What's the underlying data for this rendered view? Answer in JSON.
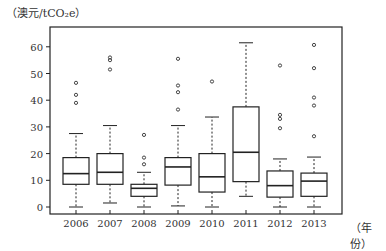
{
  "chart_data": {
    "type": "box",
    "title": "",
    "xlabel": "（年份）",
    "ylabel": "（澳元/tCO₂e）",
    "ylim": [
      0,
      65
    ],
    "yticks": [
      0,
      10,
      20,
      30,
      40,
      50,
      60
    ],
    "categories": [
      "2006",
      "2007",
      "2008",
      "2009",
      "2010",
      "2011",
      "2012",
      "2013"
    ],
    "boxes": [
      {
        "year": "2006",
        "whisker_low": 0,
        "q1": 8.5,
        "median": 12.5,
        "q3": 18.5,
        "whisker_high": 27.5,
        "outliers": [
          39,
          42,
          46.5
        ]
      },
      {
        "year": "2007",
        "whisker_low": 1.5,
        "q1": 8.5,
        "median": 13,
        "q3": 20,
        "whisker_high": 30.5,
        "outliers": [
          51.5,
          55,
          56
        ]
      },
      {
        "year": "2008",
        "whisker_low": 0,
        "q1": 4,
        "median": 7,
        "q3": 8.5,
        "whisker_high": 13,
        "outliers": [
          16,
          18.5,
          27
        ]
      },
      {
        "year": "2009",
        "whisker_low": 0.4,
        "q1": 8.2,
        "median": 15,
        "q3": 18.5,
        "whisker_high": 30.5,
        "outliers": [
          36.5,
          43,
          45.5,
          55.5
        ]
      },
      {
        "year": "2010",
        "whisker_low": 0,
        "q1": 5.6,
        "median": 11.3,
        "q3": 20,
        "whisker_high": 33.7,
        "outliers": [
          47
        ]
      },
      {
        "year": "2011",
        "whisker_low": 4,
        "q1": 9.5,
        "median": 20.5,
        "q3": 37.5,
        "whisker_high": 61.5,
        "outliers": []
      },
      {
        "year": "2012",
        "whisker_low": 0,
        "q1": 3.7,
        "median": 8,
        "q3": 13.5,
        "whisker_high": 18,
        "outliers": [
          29.5,
          33,
          34.5,
          53
        ]
      },
      {
        "year": "2013",
        "whisker_low": 0,
        "q1": 4,
        "median": 9.7,
        "q3": 12.7,
        "whisker_high": 18.7,
        "outliers": [
          26.5,
          38,
          41,
          52,
          60.7
        ]
      }
    ],
    "grid": false,
    "legend": null
  },
  "labels": {
    "ylabel": "（澳元/tCO₂e）",
    "xunit": "（年份）"
  },
  "colors": {
    "line": "#222222",
    "outlier": "#444444"
  }
}
